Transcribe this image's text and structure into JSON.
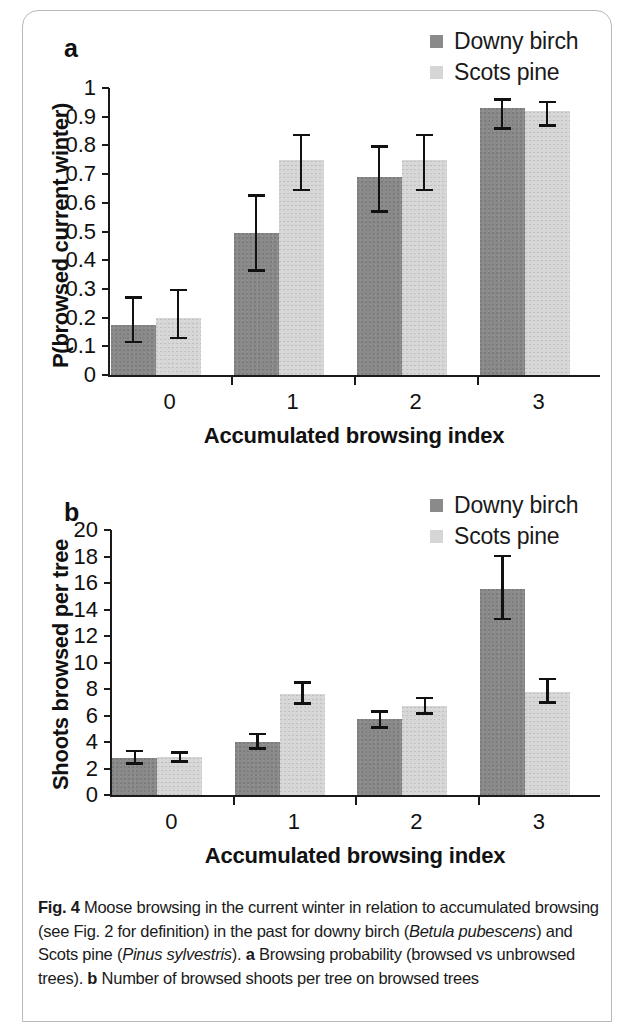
{
  "figure": {
    "id": "Fig. 4",
    "caption_segments": [
      {
        "text": "Fig. 4",
        "style": "bold"
      },
      {
        "text": " Moose browsing in the current winter in relation to accumulated browsing (see Fig. 2 for definition) in the past for downy birch (",
        "style": "normal"
      },
      {
        "text": "Betula pubescens",
        "style": "italic"
      },
      {
        "text": ") and Scots pine (",
        "style": "normal"
      },
      {
        "text": "Pinus sylvestris",
        "style": "italic"
      },
      {
        "text": "). ",
        "style": "normal"
      },
      {
        "text": "a",
        "style": "bold"
      },
      {
        "text": " Browsing probability (browsed vs unbrowsed trees). ",
        "style": "normal"
      },
      {
        "text": "b",
        "style": "bold"
      },
      {
        "text": " Number of browsed shoots per tree on browsed trees",
        "style": "normal"
      }
    ],
    "caption_plain": "Fig. 4 Moose browsing in the current winter in relation to accumulated browsing (see Fig. 2 for definition) in the past for downy birch (Betula pubescens) and Scots pine (Pinus sylvestris). a Browsing probability (browsed vs unbrowsed trees). b Number of browsed shoots per tree on browsed trees"
  },
  "colors": {
    "birch": "#8a8a8a",
    "pine": "#d6d6d6",
    "axis": "#1a1a1a",
    "frame": "#b9b9b9"
  },
  "panel_a": {
    "letter": "a",
    "legend": [
      {
        "label": "Downy birch",
        "series": "birch"
      },
      {
        "label": "Scots pine",
        "series": "pine"
      }
    ]
  },
  "panel_b": {
    "letter": "b",
    "legend": [
      {
        "label": "Downy birch",
        "series": "birch"
      },
      {
        "label": "Scots pine",
        "series": "pine"
      }
    ]
  },
  "chart_data": [
    {
      "panel": "a",
      "type": "bar",
      "title": "",
      "xlabel": "Accumulated browsing index",
      "ylabel": "P(browsed current winter)",
      "categories": [
        "0",
        "1",
        "2",
        "3"
      ],
      "ylim": [
        0,
        1
      ],
      "yticks": [
        "0",
        "0.1",
        "0.2",
        "0.3",
        "0.4",
        "0.5",
        "0.6",
        "0.7",
        "0.8",
        "0.9",
        "1"
      ],
      "ytick_values": [
        0,
        0.1,
        0.2,
        0.3,
        0.4,
        0.5,
        0.6,
        0.7,
        0.8,
        0.9,
        1
      ],
      "grid": false,
      "legend_position": "top-right",
      "series": [
        {
          "name": "Downy birch",
          "color": "#8a8a8a",
          "values": [
            0.175,
            0.495,
            0.69,
            0.93
          ],
          "err_low": [
            0.11,
            0.36,
            0.565,
            0.855
          ],
          "err_high": [
            0.275,
            0.63,
            0.8,
            0.965
          ]
        },
        {
          "name": "Scots pine",
          "color": "#d6d6d6",
          "values": [
            0.2,
            0.75,
            0.75,
            0.92
          ],
          "err_low": [
            0.125,
            0.64,
            0.64,
            0.865
          ],
          "err_high": [
            0.3,
            0.84,
            0.84,
            0.955
          ]
        }
      ]
    },
    {
      "panel": "b",
      "type": "bar",
      "title": "",
      "xlabel": "Accumulated browsing index",
      "ylabel": "Shoots browsed per tree",
      "categories": [
        "0",
        "1",
        "2",
        "3"
      ],
      "ylim": [
        0,
        20
      ],
      "yticks": [
        "0",
        "2",
        "4",
        "6",
        "8",
        "10",
        "12",
        "14",
        "16",
        "18",
        "20"
      ],
      "ytick_values": [
        0,
        2,
        4,
        6,
        8,
        10,
        12,
        14,
        16,
        18,
        20
      ],
      "grid": false,
      "legend_position": "top-right",
      "series": [
        {
          "name": "Downy birch",
          "color": "#8a8a8a",
          "values": [
            2.8,
            4.0,
            5.75,
            15.55
          ],
          "err_low": [
            2.3,
            3.4,
            5.0,
            13.2
          ],
          "err_high": [
            3.4,
            4.7,
            6.4,
            18.15
          ]
        },
        {
          "name": "Scots pine",
          "color": "#d6d6d6",
          "values": [
            2.85,
            7.65,
            6.7,
            7.8
          ],
          "err_low": [
            2.45,
            6.8,
            6.05,
            6.9
          ],
          "err_high": [
            3.3,
            8.6,
            7.4,
            8.85
          ]
        }
      ]
    }
  ]
}
